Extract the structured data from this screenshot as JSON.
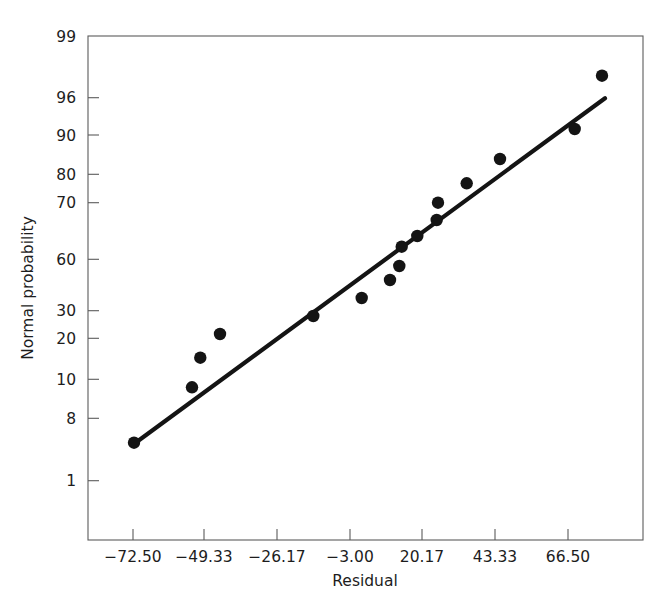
{
  "figure": {
    "background_color": "#ffffff",
    "foreground_color": "#141414",
    "axis_color": "#5b5b5b"
  },
  "axes": {
    "x_title": "Residual",
    "y_title": "Normal probability"
  },
  "chart_data": {
    "type": "scatter",
    "title": "",
    "subtitle": "",
    "xlabel": "Residual",
    "ylabel": "Normal probability",
    "grid": false,
    "legend": "none",
    "x_tick_labels": [
      "-72.50",
      "-49.33",
      "-26.17",
      "-3.00",
      "20.17",
      "43.33",
      "66.50"
    ],
    "x_tick_values": [
      -72.5,
      -49.33,
      -26.17,
      -3.0,
      20.17,
      43.33,
      66.5
    ],
    "y_tick_labels": [
      "99",
      "96",
      "90",
      "80",
      "70",
      "60",
      "30",
      "20",
      "10",
      "8",
      "1"
    ],
    "y_tick_values": [
      99,
      96,
      90,
      80,
      70,
      60,
      30,
      20,
      10,
      8,
      1
    ],
    "xlim": [
      -78.6,
      -78.6
    ],
    "x_axis_scale": "linear",
    "y_axis_scale": "normal-probability",
    "points": [
      {
        "x": -72.2,
        "y": 4.5
      },
      {
        "x": -53.8,
        "y": 9.2
      },
      {
        "x": -51.1,
        "y": 14.8
      },
      {
        "x": -44.8,
        "y": 21.5
      },
      {
        "x": -16.9,
        "y": 28.5
      },
      {
        "x": -1.5,
        "y": 34.0
      },
      {
        "x": 7.5,
        "y": 45.0
      },
      {
        "x": 10.5,
        "y": 52.0
      },
      {
        "x": 11.3,
        "y": 58.5
      },
      {
        "x": 16.3,
        "y": 62.0
      },
      {
        "x": 23.0,
        "y": 64.5
      },
      {
        "x": 23.4,
        "y": 67.5
      },
      {
        "x": 33.0,
        "y": 71.0
      },
      {
        "x": 44.0,
        "y": 77.5
      },
      {
        "x": 68.0,
        "y": 84.0
      },
      {
        "x": 77.0,
        "y": 91.5
      },
      {
        "x": 86.0,
        "y": 97.5
      }
    ],
    "reference_line": {
      "label": "fitted normal reference line",
      "x_start": -70.6,
      "y_start": 5.5,
      "x_end": 78.0,
      "y_end": 95.5
    }
  },
  "pixel_geometry": {
    "plot_box": {
      "left": 88,
      "top": 36,
      "right": 643,
      "bottom": 540
    },
    "x_ticks_px": [
      133,
      204,
      277,
      350,
      422,
      495,
      568
    ],
    "y_ticks_px": [
      36,
      97.7,
      135,
      174.3,
      202.7,
      259.3,
      310.7,
      338.3,
      379.3,
      418.3,
      480.7
    ],
    "points_px": [
      [
        134,
        442.7
      ],
      [
        192,
        387.3
      ],
      [
        200.3,
        357.7
      ],
      [
        220,
        334.0
      ],
      [
        313.3,
        316.0
      ],
      [
        361.7,
        298.0
      ],
      [
        390.0,
        280.0
      ],
      [
        399.3,
        266.0
      ],
      [
        401.7,
        246.7
      ],
      [
        417.3,
        236.0
      ],
      [
        436.7,
        220.0
      ],
      [
        438.0,
        202.7
      ],
      [
        466.7,
        183.3
      ],
      [
        500.0,
        159.0
      ],
      [
        574.7,
        129.0
      ],
      [
        602.0,
        75.7
      ]
    ],
    "line_px": {
      "x1": 139.3,
      "y1": 440.0,
      "x2": 605.0,
      "y2": 98.3
    },
    "point_radius_px": 6.2,
    "x_title_px": [
      365,
      586
    ],
    "y_title_px": [
      33,
      288
    ]
  }
}
